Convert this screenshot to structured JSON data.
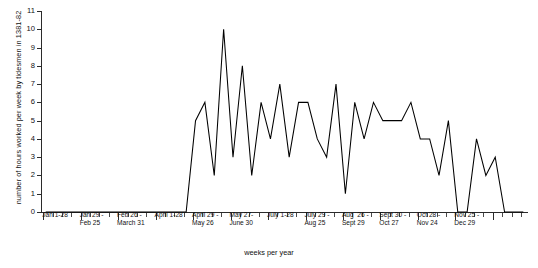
{
  "chart_data": {
    "type": "line",
    "title": "",
    "xlabel": "weeks per year",
    "ylabel": "number of hours worked per week by tidesmen in 1381-82",
    "ylim": [
      0,
      11
    ],
    "yticks": [
      0,
      1,
      2,
      3,
      4,
      5,
      6,
      7,
      8,
      9,
      10,
      11
    ],
    "ytick_labels": [
      "0",
      "1",
      "2",
      "3",
      "4",
      "5",
      "6",
      "7",
      "8",
      "9",
      "10",
      "11"
    ],
    "grid": false,
    "legend": "none",
    "xlim": [
      1,
      52
    ],
    "x": [
      1,
      2,
      3,
      4,
      5,
      6,
      7,
      8,
      9,
      10,
      11,
      12,
      13,
      14,
      15,
      16,
      17,
      18,
      19,
      20,
      21,
      22,
      23,
      24,
      25,
      26,
      27,
      28,
      29,
      30,
      31,
      32,
      33,
      34,
      35,
      36,
      37,
      38,
      39,
      40,
      41,
      42,
      43,
      44,
      45,
      46,
      47,
      48,
      49,
      50,
      51,
      52
    ],
    "values": [
      0,
      0,
      0,
      0,
      0,
      0,
      0,
      0,
      0,
      0,
      0,
      0,
      0,
      0,
      0,
      0,
      5,
      6,
      2,
      10,
      3,
      8,
      2,
      6,
      4,
      7,
      3,
      6,
      6,
      4,
      3,
      7,
      1,
      6,
      4,
      6,
      5,
      5,
      5,
      6,
      4,
      4,
      2,
      5,
      0,
      0,
      4,
      2,
      3,
      0,
      0,
      0
    ],
    "xtick_group_labels": [
      {
        "line1": "Jan 1-28",
        "line2": ""
      },
      {
        "line1": "Jan 29 -",
        "line2": "Feb 25"
      },
      {
        "line1": "Feb 26 -",
        "line2": "March 31"
      },
      {
        "line1": "April 1-28",
        "line2": ""
      },
      {
        "line1": "April 29 -",
        "line2": "May 26"
      },
      {
        "line1": "May 27-",
        "line2": "June 30"
      },
      {
        "line1": "July 1-28",
        "line2": ""
      },
      {
        "line1": "July 29 -",
        "line2": "Aug 25"
      },
      {
        "line1": "Aug  26 -",
        "line2": "Sept 29"
      },
      {
        "line1": "Sept 30 -",
        "line2": "Oct 27"
      },
      {
        "line1": "Oct 28 -",
        "line2": "Nov 24"
      },
      {
        "line1": "Nov 25 -",
        "line2": "Dec 29"
      }
    ],
    "colors": {
      "line": "#000000",
      "axis": "#2b2b2b",
      "text": "#111111",
      "background": "#ffffff"
    }
  }
}
